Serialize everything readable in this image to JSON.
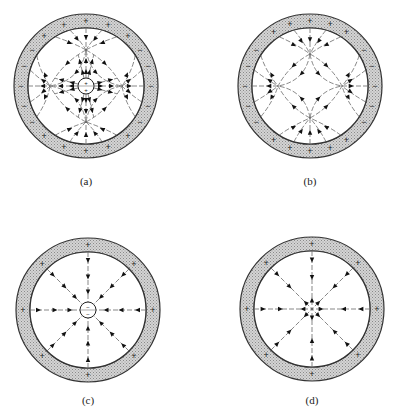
{
  "figure": {
    "panels": [
      {
        "id": "a",
        "label": "(a)",
        "center": [
          86,
          86
        ],
        "outer_radius": 72,
        "inner_radius": 58,
        "shell_charges": [
          {
            "sign": "+",
            "angle_deg": 90
          },
          {
            "sign": "+",
            "angle_deg": 70
          },
          {
            "sign": "+",
            "angle_deg": 110
          },
          {
            "sign": "+",
            "angle_deg": 50
          },
          {
            "sign": "+",
            "angle_deg": 130
          },
          {
            "sign": "+",
            "angle_deg": 270
          },
          {
            "sign": "+",
            "angle_deg": 250
          },
          {
            "sign": "+",
            "angle_deg": 290
          },
          {
            "sign": "+",
            "angle_deg": 230
          },
          {
            "sign": "+",
            "angle_deg": 310
          },
          {
            "sign": "−",
            "angle_deg": 0
          },
          {
            "sign": "−",
            "angle_deg": 18
          },
          {
            "sign": "−",
            "angle_deg": -18
          },
          {
            "sign": "−",
            "angle_deg": 34
          },
          {
            "sign": "−",
            "angle_deg": -34
          },
          {
            "sign": "−",
            "angle_deg": 180
          },
          {
            "sign": "−",
            "angle_deg": 162
          },
          {
            "sign": "−",
            "angle_deg": 198
          },
          {
            "sign": "−",
            "angle_deg": 146
          },
          {
            "sign": "−",
            "angle_deg": 214
          }
        ],
        "central_conductor": {
          "present": true,
          "radius": 8,
          "charges": [
            "+",
            "+"
          ]
        },
        "field_pattern": "quadrupole-with-central-charge"
      },
      {
        "id": "b",
        "label": "(b)",
        "center": [
          310,
          86
        ],
        "outer_radius": 72,
        "inner_radius": 58,
        "shell_charges": [
          {
            "sign": "+",
            "angle_deg": 90
          },
          {
            "sign": "+",
            "angle_deg": 72
          },
          {
            "sign": "+",
            "angle_deg": 108
          },
          {
            "sign": "+",
            "angle_deg": 56
          },
          {
            "sign": "+",
            "angle_deg": 124
          },
          {
            "sign": "+",
            "angle_deg": 270
          },
          {
            "sign": "+",
            "angle_deg": 252
          },
          {
            "sign": "+",
            "angle_deg": 288
          },
          {
            "sign": "+",
            "angle_deg": 236
          },
          {
            "sign": "+",
            "angle_deg": 304
          },
          {
            "sign": "−",
            "angle_deg": 0
          },
          {
            "sign": "−",
            "angle_deg": 18
          },
          {
            "sign": "−",
            "angle_deg": -18
          },
          {
            "sign": "−",
            "angle_deg": 34
          },
          {
            "sign": "−",
            "angle_deg": -34
          },
          {
            "sign": "−",
            "angle_deg": 180
          },
          {
            "sign": "−",
            "angle_deg": 162
          },
          {
            "sign": "−",
            "angle_deg": 198
          },
          {
            "sign": "−",
            "angle_deg": 146
          },
          {
            "sign": "−",
            "angle_deg": 214
          }
        ],
        "central_conductor": {
          "present": false
        },
        "field_pattern": "quadrupole"
      },
      {
        "id": "c",
        "label": "(c)",
        "center": [
          88,
          310
        ],
        "outer_radius": 72,
        "inner_radius": 58,
        "shell_charges": [
          {
            "sign": "+",
            "angle_deg": 0
          },
          {
            "sign": "+",
            "angle_deg": 45
          },
          {
            "sign": "+",
            "angle_deg": 90
          },
          {
            "sign": "+",
            "angle_deg": 135
          },
          {
            "sign": "+",
            "angle_deg": 180
          },
          {
            "sign": "+",
            "angle_deg": 225
          },
          {
            "sign": "+",
            "angle_deg": 270
          },
          {
            "sign": "+",
            "angle_deg": 315
          }
        ],
        "central_conductor": {
          "present": true,
          "radius": 8,
          "charges": [
            "−",
            "−"
          ]
        },
        "field_pattern": "radial-inward-to-center"
      },
      {
        "id": "d",
        "label": "(d)",
        "center": [
          312,
          309
        ],
        "outer_radius": 72,
        "inner_radius": 58,
        "shell_charges": [
          {
            "sign": "+",
            "angle_deg": 0
          },
          {
            "sign": "+",
            "angle_deg": 45
          },
          {
            "sign": "+",
            "angle_deg": 90
          },
          {
            "sign": "+",
            "angle_deg": 135
          },
          {
            "sign": "+",
            "angle_deg": 180
          },
          {
            "sign": "+",
            "angle_deg": 225
          },
          {
            "sign": "+",
            "angle_deg": 270
          },
          {
            "sign": "+",
            "angle_deg": 315
          }
        ],
        "central_conductor": {
          "present": false
        },
        "field_pattern": "radial-converging"
      }
    ],
    "colors": {
      "line": "#333333",
      "shell_fill": "#c8c8c8",
      "background": "#ffffff"
    }
  }
}
